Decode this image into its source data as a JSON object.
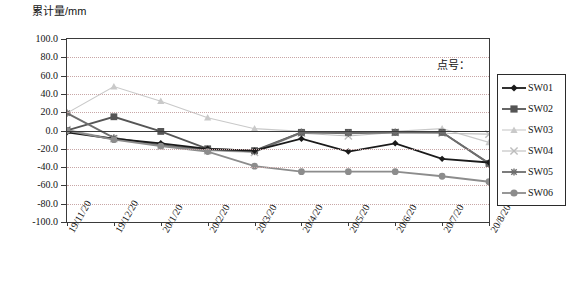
{
  "axis_title": "累计量/mm",
  "legend_caption": "点号：",
  "chart_data": {
    "type": "line",
    "title": "累计量/mm",
    "xlabel": "",
    "ylabel": "累计量/mm",
    "ylim": [
      -100.0,
      100.0
    ],
    "ytick_step": 20.0,
    "grid": true,
    "legend_position": "right",
    "categories": [
      "19/11/20",
      "19/12/20",
      "20/1/20",
      "20/2/20",
      "20/3/20",
      "20/4/20",
      "20/5/20",
      "20/6/20",
      "20/7/20",
      "20/8/20"
    ],
    "ytick_labels": [
      "100.0",
      "80.0",
      "60.0",
      "40.0",
      "20.0",
      "0.0",
      "-20.0",
      "-40.0",
      "-60.0",
      "-80.0",
      "-100.0"
    ],
    "series": [
      {
        "name": "SW01",
        "marker": "diamond",
        "color": "#1a1a1a",
        "values": [
          -2,
          -9,
          -14,
          -20,
          -22,
          -9,
          -23,
          -14,
          -31,
          -35
        ]
      },
      {
        "name": "SW02",
        "marker": "square",
        "color": "#555555",
        "values": [
          0,
          15,
          -1,
          -20,
          -22,
          -2,
          -2,
          -2,
          -2,
          -36
        ]
      },
      {
        "name": "SW03",
        "marker": "triangle",
        "color": "#c9c9c9",
        "values": [
          19,
          48,
          32,
          14,
          2,
          -1,
          -2,
          -1,
          2,
          -13
        ]
      },
      {
        "name": "SW04",
        "marker": "x",
        "color": "#bdbdbd",
        "values": [
          1,
          -9,
          -17,
          -22,
          -24,
          -3,
          -6,
          -2,
          -3,
          -4
        ]
      },
      {
        "name": "SW05",
        "marker": "star",
        "color": "#6e6e6e",
        "values": [
          19,
          -8,
          -16,
          -21,
          -23,
          -2,
          -3,
          -2,
          -2,
          -36
        ]
      },
      {
        "name": "SW06",
        "marker": "circle",
        "color": "#8c8c8c",
        "values": [
          0,
          -10,
          -17,
          -23,
          -39,
          -45,
          -45,
          -45,
          -50,
          -56
        ]
      }
    ]
  }
}
